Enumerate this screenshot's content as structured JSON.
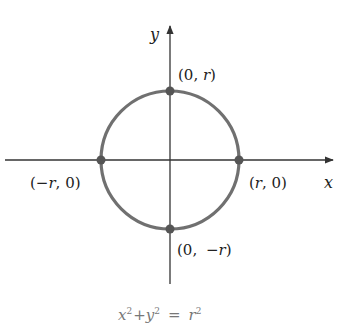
{
  "diagram": {
    "equation": {
      "x": "x",
      "plus": "+",
      "y": "y",
      "eq": "=",
      "r": "r",
      "exp": "2"
    },
    "axes": {
      "x_label": "x",
      "y_label": "y"
    },
    "points": {
      "top": {
        "open": "(0, ",
        "var": "r",
        "close": ")"
      },
      "bottom": {
        "open": "(0, ",
        "neg": "−",
        "var": "r",
        "close": ")"
      },
      "left": {
        "open": "(",
        "neg": "−",
        "var": "r",
        "close": ", 0)"
      },
      "right": {
        "open": "(",
        "var": "r",
        "close": ", 0)"
      }
    },
    "colors": {
      "circle": "#707070",
      "axis": "#333333",
      "point": "#555555",
      "equation": "#777777"
    },
    "geometry": {
      "cx": 170,
      "cy": 160,
      "radius": 69
    }
  }
}
